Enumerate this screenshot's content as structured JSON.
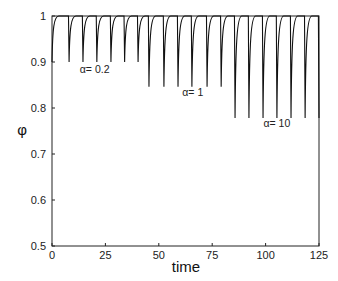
{
  "chart_data": {
    "type": "line",
    "title": "",
    "xlabel": "time",
    "ylabel": "φ",
    "xlim": [
      0,
      125
    ],
    "ylim": [
      0.5,
      1.0
    ],
    "xticks": [
      0,
      25,
      50,
      75,
      100,
      125
    ],
    "xtick_labels": [
      "0",
      "25",
      "50",
      "75",
      "100",
      "125"
    ],
    "yticks": [
      0.5,
      0.6,
      0.7,
      0.8,
      0.9,
      1.0
    ],
    "ytick_labels": [
      "0.5",
      "0.6",
      "0.7",
      "0.8",
      "0.9",
      "1"
    ],
    "grid": false,
    "legend": null,
    "baseline": 1.0,
    "period_approx": 6.6,
    "series": [
      {
        "name": "α= 0.2",
        "dip_minimum": 0.9,
        "dip_times": [
          0,
          8.0,
          14.5,
          21.0,
          27.6,
          34.0,
          40.3
        ]
      },
      {
        "name": "α= 1",
        "dip_minimum": 0.846,
        "dip_times": [
          45.4,
          52.4,
          59.0,
          65.5,
          72.6,
          79.2
        ]
      },
      {
        "name": "α= 10",
        "dip_minimum": 0.778,
        "dip_times": [
          85.7,
          92.2,
          98.8,
          105.3,
          111.9,
          118.5,
          125.0
        ]
      }
    ],
    "annotations": [
      {
        "text": "α= 0.2",
        "x": 13,
        "y": 0.877
      },
      {
        "text": "α= 1",
        "x": 61,
        "y": 0.826
      },
      {
        "text": "α= 10",
        "x": 99,
        "y": 0.758
      }
    ]
  },
  "labels": {
    "xlabel": "time",
    "ylabel": "φ",
    "anno_0": "α= 0.2",
    "anno_1": "α= 1",
    "anno_2": "α= 10"
  }
}
